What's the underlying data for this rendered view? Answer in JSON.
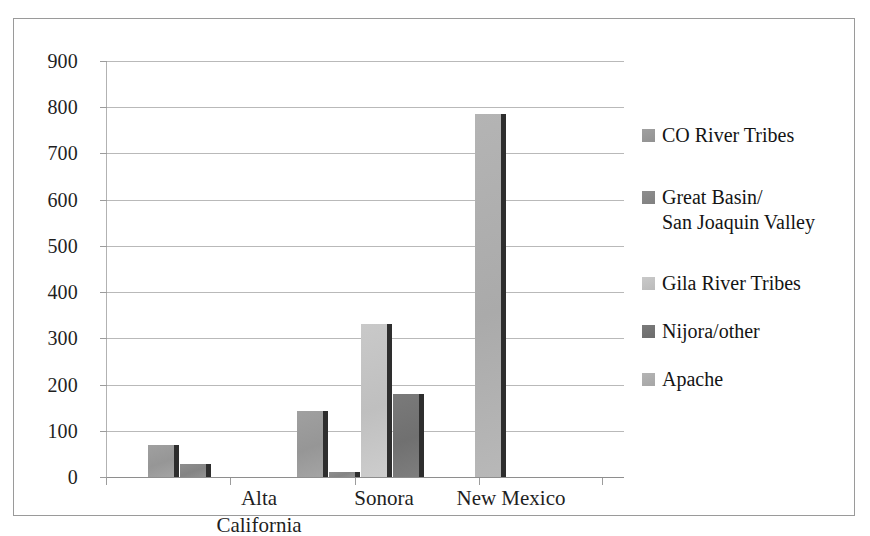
{
  "chart_data": {
    "type": "bar",
    "title": "",
    "subtitle": "",
    "xlabel": "",
    "ylabel": "",
    "ylim": [
      0,
      900
    ],
    "ytick_step": 100,
    "yticks": [
      900,
      800,
      700,
      600,
      500,
      400,
      300,
      200,
      100,
      0
    ],
    "ytick_labels": [
      "900",
      "800",
      "700",
      "600",
      "500",
      "400",
      "300",
      "200",
      "100",
      "0"
    ],
    "grid": true,
    "grid_axis": "y",
    "legend_position": "right",
    "orientation": "vertical",
    "grouping": "clustered",
    "categories": [
      "Alta\nCalifornia",
      "Sonora",
      "New Mexico"
    ],
    "category_labels_flat": [
      "Alta California",
      "Sonora",
      "New Mexico"
    ],
    "series": [
      {
        "name": "CO River Tribes",
        "color": "#A0A0A0",
        "values": [
          70,
          143,
          0
        ]
      },
      {
        "name": "Great Basin/\nSan Joaquin Valley",
        "color": "#8E8E8E",
        "values": [
          28,
          10,
          0
        ]
      },
      {
        "name": "Gila River Tribes",
        "color": "#C9C9C9",
        "values": [
          0,
          330,
          0
        ]
      },
      {
        "name": "Nijora/other",
        "color": "#7A7A7A",
        "values": [
          0,
          180,
          0
        ]
      },
      {
        "name": "Apache",
        "color": "#B4B4B4",
        "values": [
          0,
          0,
          785
        ]
      }
    ],
    "annotations": [],
    "shadow_color": "#2E2E2E",
    "gridline_color": "#B9B9B9",
    "axis_color": "#8E8E8E",
    "frame_color": "#9A9A9A",
    "background": "#FFFFFF"
  },
  "legend": {
    "items": [
      {
        "label": "CO River Tribes",
        "color": "#A0A0A0"
      },
      {
        "label": "Great Basin/\nSan Joaquin Valley",
        "color": "#8E8E8E"
      },
      {
        "label": "Gila River Tribes",
        "color": "#C9C9C9"
      },
      {
        "label": "Nijora/other",
        "color": "#7A7A7A"
      },
      {
        "label": "Apache",
        "color": "#B4B4B4"
      }
    ]
  }
}
